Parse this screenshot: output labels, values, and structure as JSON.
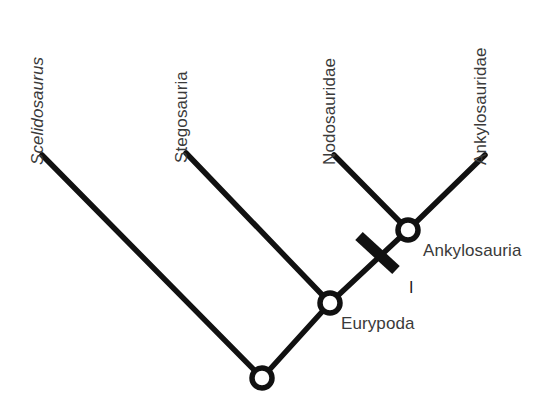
{
  "figure": {
    "type": "cladogram",
    "background_color": "#ffffff",
    "line_color": "#111111",
    "text_color": "#3a3a3a",
    "node_fill": "#ffffff",
    "width": 549,
    "height": 413
  },
  "taxa": [
    {
      "label": "Scelidosaurus",
      "style": "italic",
      "rotation_deg": -90,
      "tip_x": 42,
      "tip_y": 155,
      "label_x": 46,
      "label_y": 148
    },
    {
      "label": "Stegosauria",
      "style": "normal",
      "rotation_deg": -90,
      "tip_x": 186,
      "tip_y": 153,
      "label_x": 190,
      "label_y": 146
    },
    {
      "label": "Nodosauridae",
      "style": "normal",
      "rotation_deg": -90,
      "tip_x": 334,
      "tip_y": 155,
      "label_x": 338,
      "label_y": 148
    },
    {
      "label": "Ankylosauridae",
      "style": "normal",
      "rotation_deg": -90,
      "tip_x": 485,
      "tip_y": 155,
      "label_x": 489,
      "label_y": 148
    }
  ],
  "nodes": [
    {
      "name": "root-node",
      "label": "",
      "x": 262,
      "y": 378,
      "radius": 10
    },
    {
      "name": "eurypoda-node",
      "label": "Eurypoda",
      "x": 330,
      "y": 303,
      "radius": 10,
      "label_x": 341,
      "label_y": 315
    },
    {
      "name": "ankylosauria-node",
      "label": "Ankylosauria",
      "x": 408,
      "y": 230,
      "radius": 10,
      "label_x": 423,
      "label_y": 242
    }
  ],
  "branches": [
    {
      "name": "branch-scelidosaurus",
      "x1": 42,
      "y1": 155,
      "x2": 262,
      "y2": 378
    },
    {
      "name": "branch-root-to-eurypoda",
      "x1": 262,
      "y1": 378,
      "x2": 330,
      "y2": 303
    },
    {
      "name": "branch-stegosauria",
      "x1": 186,
      "y1": 153,
      "x2": 330,
      "y2": 303
    },
    {
      "name": "branch-eurypoda-to-ankylosauria",
      "x1": 330,
      "y1": 303,
      "x2": 408,
      "y2": 230
    },
    {
      "name": "branch-nodosauridae",
      "x1": 334,
      "y1": 155,
      "x2": 408,
      "y2": 230
    },
    {
      "name": "branch-ankylosauridae",
      "x1": 485,
      "y1": 155,
      "x2": 408,
      "y2": 230
    }
  ],
  "character_marks": [
    {
      "name": "character-tick-1",
      "label": "I",
      "x1": 359,
      "y1": 236,
      "x2": 396,
      "y2": 270,
      "thickness": 11,
      "label_x": 409,
      "label_y": 280
    }
  ]
}
